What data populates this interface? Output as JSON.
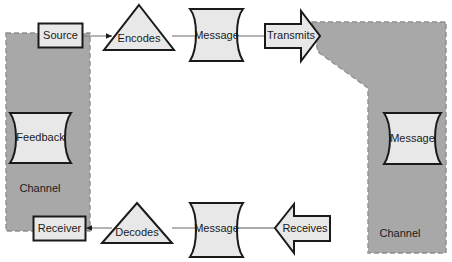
{
  "diagram": {
    "colors": {
      "channel_fill": "#a8a8a8",
      "channel_border": "#8f8f8f",
      "shape_fill": "#e8e8e8",
      "shape_stroke": "#1a1a1a",
      "connector": "#8c8c8c",
      "background": "#ffffff",
      "text": "#1a1a1a"
    },
    "channels": [
      {
        "id": "channel-left",
        "label": "Channel"
      },
      {
        "id": "channel-right",
        "label": "Channel"
      }
    ],
    "nodes": {
      "source": {
        "label": "Source",
        "shape": "rectangle"
      },
      "encodes": {
        "label": "Encodes",
        "shape": "triangle"
      },
      "message_top": {
        "label": "Message",
        "shape": "document"
      },
      "transmits": {
        "label": "Transmits",
        "shape": "arrow-right"
      },
      "message_right": {
        "label": "Message",
        "shape": "document"
      },
      "receives": {
        "label": "Receives",
        "shape": "arrow-left"
      },
      "message_bottom": {
        "label": "Message",
        "shape": "document"
      },
      "decodes": {
        "label": "Decodes",
        "shape": "triangle"
      },
      "receiver": {
        "label": "Receiver",
        "shape": "rectangle"
      },
      "feedback": {
        "label": "Feedback",
        "shape": "document"
      }
    }
  }
}
